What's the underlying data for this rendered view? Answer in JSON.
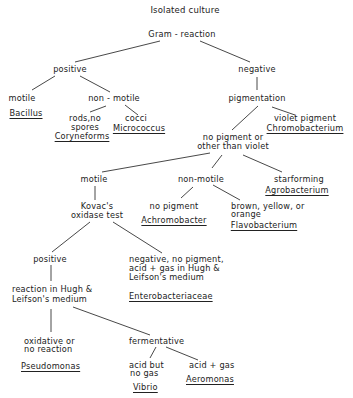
{
  "title": "Isolated culture",
  "root": "Gram - reaction",
  "gram_positive": {
    "label": "positive",
    "motile": {
      "label": "motile",
      "organism": "Bacillus"
    },
    "non_motile": {
      "label": "non - motile",
      "rods": {
        "label_line1": "rods,no",
        "label_line2": "spores",
        "organism": "Coryneforms"
      },
      "cocci": {
        "label": "cocci",
        "organism": "Micrococcus"
      }
    }
  },
  "gram_negative": {
    "label": "negative",
    "pigmentation": {
      "label": "pigmentation",
      "violet": {
        "label": "violet pigment",
        "organism": "Chromobacterium"
      },
      "other": {
        "label_line1": "no pigment or",
        "label_line2": "other than violet",
        "starforming": {
          "label": "starforming",
          "organism": "Agrobacterium"
        },
        "non_motile": {
          "label": "non-motile",
          "no_pigment": {
            "label": "no  pigment",
            "organism": "Achromobacter"
          },
          "brown": {
            "label_line1": "brown, yellow, or",
            "label_line2": "orange",
            "organism": "Flavobacterium"
          }
        },
        "motile": {
          "label": "motile",
          "kovac": {
            "label_line1": "Kovac's",
            "label_line2": "oxidase test",
            "negative": {
              "label_line1": "negative, no pigment,",
              "label_line2": "acid + gas in Hugh &",
              "label_line3": "Leifson's medium",
              "organism": "Enterobacteriaceae"
            },
            "positive": {
              "label": "positive",
              "hugh": {
                "label_line1": "reaction in Hugh &",
                "label_line2": "Leifson's medium",
                "oxidative": {
                  "label_line1": "oxidative  or",
                  "label_line2": "no reaction",
                  "organism": "Pseudomonas"
                },
                "fermentative": {
                  "label": "fermentative",
                  "acid_no_gas": {
                    "label_line1": "acid but",
                    "label_line2": "no gas",
                    "organism": "Vibrio"
                  },
                  "acid_gas": {
                    "label": "acid + gas",
                    "organism": "Aeromonas"
                  }
                }
              }
            }
          }
        }
      }
    }
  },
  "colors": {
    "line": "#333333",
    "text": "#222222",
    "background": "#ffffff"
  }
}
